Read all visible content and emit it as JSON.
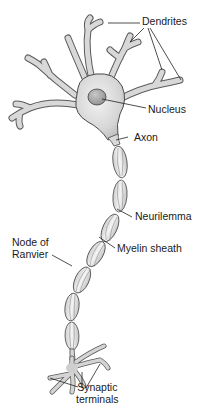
{
  "diagram": {
    "colors": {
      "background": "#ffffff",
      "cell_fill": "#d9d9d9",
      "cell_highlight": "#efefef",
      "outline": "#4a4a4a",
      "nucleus_fill": "#a8a8a8",
      "leader_line": "#222222",
      "text": "#1a1a1a"
    },
    "labels": {
      "dendrites": "Dendrites",
      "nucleus": "Nucleus",
      "axon": "Axon",
      "neurilemma": "Neurilemma",
      "myelin_sheath": "Myelin sheath",
      "node_of_ranvier": "Node of\nRanvier",
      "synaptic_terminals": "Synaptic\nterminals"
    }
  }
}
